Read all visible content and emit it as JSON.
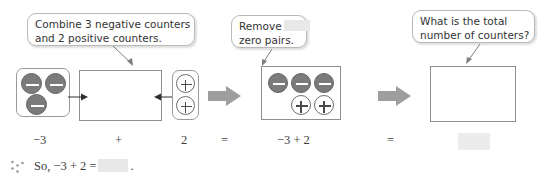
{
  "callouts": [
    {
      "id": "combine",
      "line1": "Combine 3 negative counters",
      "line2": "and 2 positive counters."
    },
    {
      "id": "remove",
      "line1": "Remove",
      "line2": "zero pairs."
    },
    {
      "id": "total",
      "line1": "What is the total",
      "line2": "number of counters?"
    }
  ],
  "equation_labels": {
    "minus_three": "−3",
    "plus": "+",
    "two": "2",
    "equals_1": "=",
    "expression": "−3 + 2",
    "equals_2": "="
  },
  "final": {
    "prefix": "So, −3 + 2 =",
    "period": "."
  },
  "counters": {
    "negative_symbol": "−",
    "positive_symbol": "+",
    "left_group_count": 3,
    "right_group_count": 2,
    "middle_negatives": 3,
    "middle_positives": 2
  },
  "colors": {
    "negative_fill": "#7b7b7b",
    "positive_fill": "#ffffff",
    "blank_fill": "#e8e8e8",
    "step_arrow": "#9e9e9e",
    "box_border": "#8f8f8f",
    "text": "#3d3d3d"
  }
}
